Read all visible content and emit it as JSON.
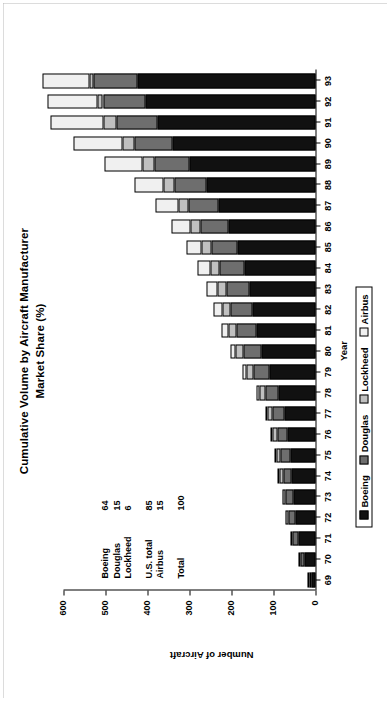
{
  "chart_data": {
    "type": "bar",
    "title": "Cumulative Volume by Aircraft Manufacturer",
    "subtitle": "Market Share (%)",
    "xlabel": "Year",
    "ylabel": "Number of Aircraft",
    "ylim": [
      0,
      600
    ],
    "yticks": [
      600,
      500,
      400,
      300,
      200,
      100,
      0
    ],
    "ytick_labels": [
      "600",
      "500",
      "400",
      "300",
      "200",
      "100",
      "0"
    ],
    "grid": false,
    "orientation": "rotated-90",
    "legend_position": "bottom",
    "categories": [
      "69",
      "70",
      "71",
      "72",
      "73",
      "74",
      "75",
      "76",
      "77",
      "78",
      "79",
      "80",
      "81",
      "82",
      "83",
      "84",
      "85",
      "86",
      "87",
      "88",
      "89",
      "90",
      "91",
      "92",
      "93"
    ],
    "series": [
      {
        "name": "Boeing",
        "color": "#111111",
        "values": [
          10,
          26,
          40,
          47,
          52,
          56,
          60,
          66,
          74,
          88,
          110,
          128,
          140,
          150,
          158,
          170,
          186,
          208,
          232,
          260,
          300,
          340,
          376,
          404,
          424
        ]
      },
      {
        "name": "Douglas",
        "color": "#6e6e6e",
        "values": [
          4,
          9,
          14,
          17,
          19,
          21,
          23,
          25,
          28,
          32,
          38,
          44,
          48,
          52,
          55,
          58,
          62,
          66,
          70,
          76,
          84,
          92,
          98,
          102,
          104
        ]
      },
      {
        "name": "Lockheed",
        "color": "#c0c0c0",
        "values": [
          2,
          4,
          6,
          7,
          8,
          9,
          10,
          11,
          12,
          14,
          16,
          18,
          19,
          20,
          21,
          22,
          23,
          24,
          25,
          26,
          27,
          28,
          30,
          12,
          9
        ]
      },
      {
        "name": "Airbus",
        "color": "#f0f0f0",
        "values": [
          0,
          0,
          0,
          0,
          0,
          1,
          2,
          3,
          4,
          6,
          9,
          13,
          17,
          21,
          25,
          30,
          36,
          44,
          54,
          70,
          92,
          116,
          128,
          120,
          112
        ]
      }
    ]
  },
  "annotation": {
    "rows": [
      {
        "label": "Boeing",
        "value": "64"
      },
      {
        "label": "Douglas",
        "value": "15"
      },
      {
        "label": "Lockheed",
        "value": "6"
      }
    ],
    "rows2": [
      {
        "label": "U.S. total",
        "value": "85"
      },
      {
        "label": "Airbus",
        "value": "15"
      }
    ],
    "rows3": [
      {
        "label": "Total",
        "value": "100"
      }
    ]
  }
}
